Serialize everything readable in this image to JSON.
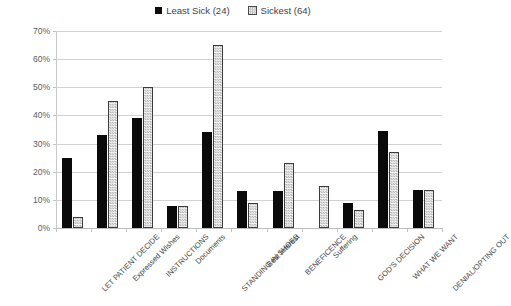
{
  "chart_data": {
    "type": "bar",
    "title": "",
    "subtitle": "",
    "xlabel": "",
    "ylabel": "",
    "ylim": [
      0,
      70
    ],
    "ytick_labels": [
      "0%",
      "10%",
      "20%",
      "30%",
      "40%",
      "50%",
      "60%",
      "70%"
    ],
    "ytick_values": [
      0,
      10,
      20,
      30,
      40,
      50,
      60,
      70
    ],
    "grid": true,
    "legend_position": "top-center",
    "categories": [
      "LET PATIENT DECIDE",
      "Expressed Wishes",
      "INSTRUCTIONS",
      "Documents",
      "STANDING IN SHOES",
      "Best Interest",
      "BENEFICENCE",
      "Suffering",
      "GOD'S DECISION",
      "WHAT WE WANT",
      "DENIAL/OPTING OUT"
    ],
    "series": [
      {
        "name": "Least Sick (24)",
        "style": "solid-black",
        "color": "#0a0a0a",
        "values": [
          25,
          33,
          39,
          8,
          34,
          13,
          13,
          0,
          9,
          34.5,
          13.5
        ]
      },
      {
        "name": "Sickest (64)",
        "style": "dotted-pattern",
        "color": "#f3f3f3",
        "values": [
          4,
          45,
          50,
          8,
          65,
          9,
          23,
          15,
          6.5,
          27,
          13.5
        ]
      }
    ]
  },
  "legend": {
    "entries": [
      {
        "label": "Least Sick (24)",
        "marker": "solid-square-icon"
      },
      {
        "label": "Sickest (64)",
        "marker": "dotted-square-icon"
      }
    ]
  },
  "colors": {
    "background": "#ffffff",
    "gridline": "#d2d2d2",
    "axis": "#c2c2c2",
    "series_least_sick": "#0a0a0a",
    "series_sickest_fill": "#f3f3f3",
    "series_sickest_outline": "#3d3d3d",
    "text": "#3f3f3f"
  }
}
